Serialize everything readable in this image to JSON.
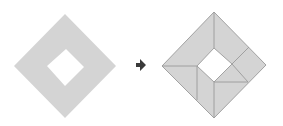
{
  "diagram": {
    "colors": {
      "fill": "#d4d4d4",
      "stroke": "#9a9a9a",
      "hole": "#ffffff",
      "arrow": "#3a3a3a",
      "background": "#ffffff"
    },
    "left_figure": {
      "label": "",
      "outer": [
        [
          65,
          14
        ],
        [
          116,
          66
        ],
        [
          65,
          118
        ],
        [
          14,
          66
        ]
      ],
      "hole": [
        [
          66,
          49
        ],
        [
          84,
          67
        ],
        [
          65,
          86
        ],
        [
          47,
          66
        ]
      ]
    },
    "arrow": {
      "direction": "right",
      "points": [
        [
          136,
          63
        ],
        [
          140,
          63
        ],
        [
          140,
          59
        ],
        [
          146,
          65
        ],
        [
          140,
          71
        ],
        [
          140,
          67
        ],
        [
          136,
          67
        ]
      ]
    },
    "right_figure": {
      "label": "",
      "outer": [
        [
          214,
          12
        ],
        [
          266,
          65
        ],
        [
          214,
          118
        ],
        [
          162,
          66
        ]
      ],
      "hole": [
        [
          214,
          48
        ],
        [
          232,
          64
        ],
        [
          214,
          82
        ],
        [
          197,
          66
        ]
      ],
      "cut_lines": [
        [
          [
            214,
            12
          ],
          [
            214,
            48
          ]
        ],
        [
          [
            162,
            66
          ],
          [
            197,
            66
          ]
        ],
        [
          [
            197,
            66
          ],
          [
            197,
            100
          ]
        ],
        [
          [
            214,
            82
          ],
          [
            214,
            118
          ]
        ],
        [
          [
            214,
            82
          ],
          [
            248,
            82
          ]
        ],
        [
          [
            232,
            64
          ],
          [
            249,
            47
          ]
        ],
        [
          [
            232,
            64
          ],
          [
            248,
            82
          ]
        ]
      ]
    }
  }
}
